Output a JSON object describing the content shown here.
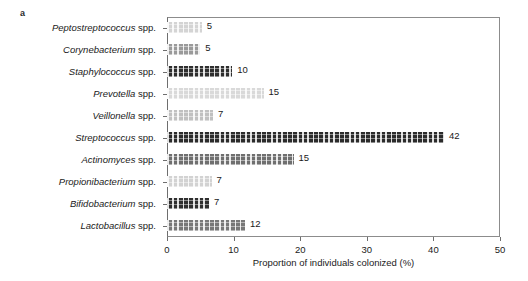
{
  "figure": {
    "panel_letter": "a"
  },
  "chart_data": {
    "type": "bar",
    "orientation": "horizontal",
    "title": "",
    "subtitle": "",
    "xlabel": "Proportion of individuals colonized (%)",
    "ylabel": "",
    "xlim": [
      0,
      50
    ],
    "xticks": [
      0,
      10,
      20,
      30,
      40,
      50
    ],
    "xticklabels": [
      "0",
      "10",
      "20",
      "30",
      "40",
      "50"
    ],
    "grid": false,
    "legend": null,
    "categories": [
      "Peptostreptococcus spp.",
      "Corynebacterium spp.",
      "Staphylococcus spp.",
      "Prevotella spp.",
      "Veillonella spp.",
      "Streptococcus spp.",
      "Actinomyces spp.",
      "Propionibacterium spp.",
      "Bifidobacterium spp.",
      "Lactobacillus spp."
    ],
    "genus_names": [
      "Peptostreptococcus",
      "Corynebacterium",
      "Staphylococcus",
      "Prevotella",
      "Veillonella",
      "Streptococcus",
      "Actinomyces",
      "Propionibacterium",
      "Bifidobacterium",
      "Lactobacillus"
    ],
    "suffix": "spp.",
    "values": [
      5,
      5,
      10,
      15,
      7,
      42,
      15,
      7,
      7,
      12
    ],
    "data_labels": [
      "5",
      "5",
      "10",
      "15",
      "7",
      "42",
      "15",
      "7",
      "7",
      "12"
    ],
    "bar_lengths_percent": [
      5.2,
      5.0,
      9.8,
      14.5,
      6.9,
      41.6,
      19.0,
      6.7,
      6.3,
      11.7
    ],
    "bar_colors": [
      "#d4d4d4",
      "#9a9a9a",
      "#2e2e2e",
      "#d9d9d9",
      "#c0c0c0",
      "#2b2b2b",
      "#6f6f6f",
      "#d2d2d2",
      "#2f2f2f",
      "#787878"
    ]
  },
  "colors": {
    "axis": "#6e6e6e",
    "frame": "#8c8c8c",
    "text": "#1a1a1a",
    "background": "#ffffff"
  }
}
